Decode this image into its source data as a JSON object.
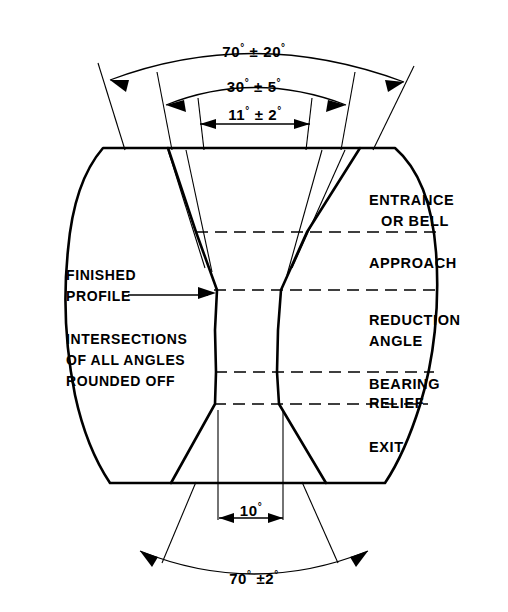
{
  "figure": {
    "background_color": "#ffffff",
    "line_color": "#000000"
  },
  "dimensions": {
    "entrance_bell_angle": "70° ± 20°",
    "approach_angle": "30° ± 5°",
    "reduction_angle": "11° ± 2°",
    "bearing_relief_angle": "10°",
    "exit_angle": "70° ±2°",
    "degree_symbol": "°",
    "plus_minus_symbol": "±"
  },
  "zones": [
    {
      "id": "entrance-or-bell",
      "line1": "ENTRANCE",
      "line2": "OR BELL"
    },
    {
      "id": "approach",
      "line1": "APPROACH",
      "line2": ""
    },
    {
      "id": "reduction-angle",
      "line1": "REDUCTION",
      "line2": "ANGLE"
    },
    {
      "id": "bearing-relief",
      "line1": "BEARING",
      "line2": "RELIEF"
    },
    {
      "id": "exit",
      "line1": "EXIT",
      "line2": ""
    }
  ],
  "notes": {
    "finished_profile": {
      "line1": "FINISHED",
      "line2": "PROFILE"
    },
    "rounded": {
      "line1": "INTERSECTIONS",
      "line2": "OF ALL ANGLES",
      "line3": "ROUNDED OFF"
    }
  },
  "dim_labels": {
    "top_outer": {
      "value": "70",
      "tol": "20"
    },
    "top_middle": {
      "value": "30",
      "tol": "5"
    },
    "top_inner": {
      "value": "11",
      "tol": "2"
    },
    "bottom_inner": {
      "value": "10"
    },
    "bottom_outer": {
      "value": "70",
      "tol": "2"
    }
  }
}
